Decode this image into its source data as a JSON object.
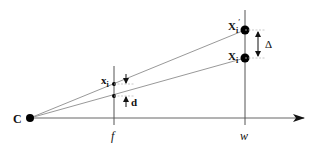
{
  "diagram": {
    "type": "pinhole-projection-geometry",
    "labels": {
      "center": "C",
      "focal": "f",
      "depth": "w",
      "point_world": "X",
      "point_world_sub": "i",
      "point_world_prime": "X",
      "point_world_prime_sub": "i",
      "point_world_prime_mark": "′",
      "point_image": "x",
      "point_image_sub": "i",
      "disparity_image": "d",
      "disparity_world": "Δ"
    },
    "colors": {
      "line": "#888888",
      "axis": "#555555",
      "point": "#000000",
      "text": "#111111"
    }
  }
}
